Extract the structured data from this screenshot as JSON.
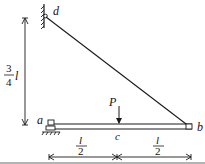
{
  "figure": {
    "type": "structural mechanics diagram",
    "colors": {
      "line": "#1a1a1a",
      "background": "#ffffff",
      "bottom_rule": "#9a9a9a"
    }
  },
  "labels": {
    "point_a": "a",
    "point_b": "b",
    "point_c": "c",
    "point_d": "d",
    "load": "P"
  },
  "dimensions": {
    "vertical": {
      "numerator": "3",
      "denominator": "4",
      "variable": "l"
    },
    "left_span": {
      "numerator": "l",
      "denominator": "2"
    },
    "right_span": {
      "numerator": "l",
      "denominator": "2"
    }
  }
}
